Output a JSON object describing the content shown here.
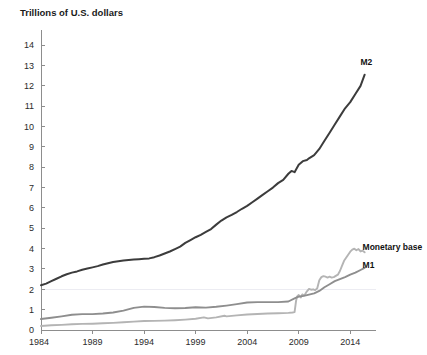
{
  "chart_data": {
    "type": "line",
    "title": "Trillions of U.S. dollars",
    "xlabel": "",
    "ylabel": "Trillions of U.S. dollars",
    "xlim": [
      1984,
      2016.5
    ],
    "ylim": [
      0,
      14.6
    ],
    "grid": false,
    "legend_position": "inline-right-end",
    "y_ticks": [
      0,
      1,
      2,
      3,
      4,
      5,
      6,
      7,
      8,
      9,
      10,
      11,
      12,
      13,
      14
    ],
    "y_tick_labels": [
      "0",
      "1",
      "2",
      "3",
      "4",
      "5",
      "6",
      "7",
      "8",
      "9",
      "10",
      "11",
      "12",
      "13",
      "14"
    ],
    "x_ticks": [
      1984,
      1989,
      1994,
      1999,
      2004,
      2009,
      2014
    ],
    "x_tick_labels": [
      "1984",
      "1989",
      "1994",
      "1999",
      "2004",
      "2009",
      "2014"
    ],
    "colors": {
      "m2": "#3c3c3c",
      "m1": "#8e8e8e",
      "monetary_base": "#b4b4b4",
      "axis": "#8d8d8d",
      "text": "#1a1a1a"
    },
    "series": [
      {
        "name": "M2",
        "label": "M2",
        "color": "#3c3c3c",
        "label_x": 2015.0,
        "label_y": 13.05,
        "x": [
          1984.0,
          1984.5,
          1985.0,
          1985.5,
          1986.0,
          1986.5,
          1987.0,
          1987.5,
          1988.0,
          1988.5,
          1989.0,
          1989.5,
          1990.0,
          1990.5,
          1991.0,
          1991.5,
          1992.0,
          1992.5,
          1993.0,
          1993.5,
          1994.0,
          1994.5,
          1995.0,
          1995.5,
          1996.0,
          1996.5,
          1997.0,
          1997.5,
          1998.0,
          1998.5,
          1999.0,
          1999.5,
          2000.0,
          2000.5,
          2001.0,
          2001.5,
          2002.0,
          2002.5,
          2003.0,
          2003.5,
          2004.0,
          2004.5,
          2005.0,
          2005.5,
          2006.0,
          2006.5,
          2007.0,
          2007.5,
          2008.0,
          2008.3,
          2008.6,
          2009.0,
          2009.4,
          2009.8,
          2010.0,
          2010.5,
          2011.0,
          2011.5,
          2012.0,
          2012.5,
          2013.0,
          2013.5,
          2014.0,
          2014.5,
          2015.0,
          2015.4
        ],
        "values": [
          2.2,
          2.28,
          2.4,
          2.52,
          2.64,
          2.74,
          2.82,
          2.88,
          2.96,
          3.02,
          3.08,
          3.14,
          3.22,
          3.28,
          3.34,
          3.38,
          3.42,
          3.44,
          3.46,
          3.48,
          3.5,
          3.52,
          3.58,
          3.66,
          3.76,
          3.86,
          3.98,
          4.1,
          4.28,
          4.42,
          4.56,
          4.68,
          4.82,
          4.96,
          5.18,
          5.38,
          5.54,
          5.66,
          5.8,
          5.96,
          6.1,
          6.28,
          6.46,
          6.64,
          6.82,
          7.0,
          7.22,
          7.38,
          7.68,
          7.82,
          7.76,
          8.12,
          8.3,
          8.36,
          8.44,
          8.6,
          8.9,
          9.3,
          9.7,
          10.1,
          10.5,
          10.9,
          11.2,
          11.6,
          12.0,
          12.55
        ]
      },
      {
        "name": "Monetary base",
        "label": "Monetary base",
        "color": "#b4b4b4",
        "label_x": 2015.2,
        "label_y": 3.95,
        "x": [
          1984.0,
          1985.0,
          1986.0,
          1987.0,
          1988.0,
          1989.0,
          1990.0,
          1991.0,
          1992.0,
          1993.0,
          1994.0,
          1995.0,
          1996.0,
          1997.0,
          1998.0,
          1999.0,
          1999.8,
          2000.2,
          2001.0,
          2001.8,
          2002.0,
          2003.0,
          2004.0,
          2005.0,
          2006.0,
          2007.0,
          2008.0,
          2008.4,
          2008.6,
          2008.75,
          2008.85,
          2009.0,
          2009.2,
          2009.35,
          2009.5,
          2009.65,
          2009.8,
          2010.0,
          2010.2,
          2010.4,
          2010.6,
          2010.8,
          2011.0,
          2011.2,
          2011.4,
          2011.6,
          2011.8,
          2012.0,
          2012.2,
          2012.4,
          2012.6,
          2012.8,
          2013.0,
          2013.2,
          2013.4,
          2013.6,
          2013.8,
          2014.0,
          2014.2,
          2014.4,
          2014.6,
          2014.8,
          2015.0,
          2015.2,
          2015.4
        ],
        "values": [
          0.2,
          0.23,
          0.25,
          0.28,
          0.3,
          0.31,
          0.33,
          0.35,
          0.38,
          0.41,
          0.44,
          0.45,
          0.46,
          0.48,
          0.51,
          0.55,
          0.62,
          0.57,
          0.62,
          0.7,
          0.67,
          0.72,
          0.76,
          0.79,
          0.81,
          0.82,
          0.84,
          0.86,
          0.88,
          1.45,
          1.65,
          1.72,
          1.6,
          1.75,
          1.7,
          1.78,
          1.9,
          2.02,
          1.98,
          2.0,
          1.96,
          2.05,
          2.45,
          2.6,
          2.65,
          2.62,
          2.58,
          2.62,
          2.58,
          2.6,
          2.66,
          2.72,
          2.9,
          3.15,
          3.4,
          3.55,
          3.7,
          3.85,
          3.95,
          4.0,
          3.92,
          3.98,
          3.86,
          3.9,
          3.82
        ]
      },
      {
        "name": "M1",
        "label": "M1",
        "color": "#8e8e8e",
        "label_x": 2015.2,
        "label_y": 3.05,
        "x": [
          1984.0,
          1985.0,
          1986.0,
          1987.0,
          1988.0,
          1989.0,
          1990.0,
          1991.0,
          1992.0,
          1993.0,
          1994.0,
          1995.0,
          1996.0,
          1997.0,
          1998.0,
          1999.0,
          2000.0,
          2001.0,
          2002.0,
          2003.0,
          2004.0,
          2005.0,
          2006.0,
          2007.0,
          2008.0,
          2008.6,
          2009.0,
          2009.5,
          2010.0,
          2010.5,
          2011.0,
          2011.5,
          2012.0,
          2012.5,
          2013.0,
          2013.5,
          2014.0,
          2014.5,
          2015.0,
          2015.4
        ],
        "values": [
          0.54,
          0.6,
          0.67,
          0.75,
          0.78,
          0.78,
          0.81,
          0.86,
          0.95,
          1.09,
          1.15,
          1.13,
          1.09,
          1.07,
          1.08,
          1.12,
          1.1,
          1.14,
          1.2,
          1.27,
          1.35,
          1.37,
          1.37,
          1.37,
          1.4,
          1.55,
          1.64,
          1.68,
          1.74,
          1.8,
          1.92,
          2.1,
          2.25,
          2.4,
          2.5,
          2.6,
          2.72,
          2.82,
          2.95,
          3.05
        ]
      }
    ]
  }
}
